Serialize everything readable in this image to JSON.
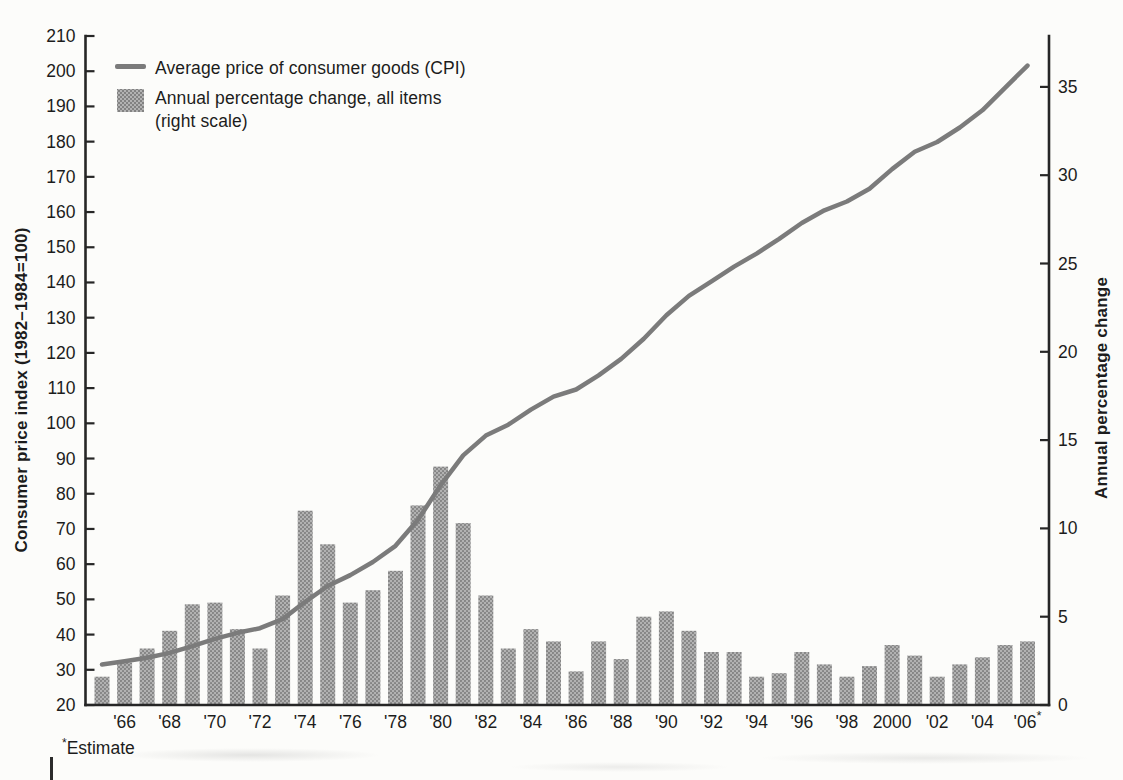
{
  "legend": {
    "line_label": "Average price of consumer goods (CPI)",
    "bar_label_line1": "Annual percentage change, all items",
    "bar_label_line2": "(right scale)"
  },
  "left_axis_title": "Consumer price index (1982–1984=100)",
  "right_axis_title": "Annual percentage change",
  "note": {
    "asterisk": "*",
    "text": "Estimate"
  },
  "colors": {
    "bar_fill": "#a2a2a2",
    "bar_dot": "#828282",
    "bar_base": "#b2b2b2",
    "line": "#7b7b7b",
    "axis": "#262626",
    "background": "#fcfcfa",
    "text": "#1c1c1c"
  },
  "chart_data": {
    "type": "bar",
    "subtype": "bar-and-line-dual-axis",
    "x": [
      1965,
      1966,
      1967,
      1968,
      1969,
      1970,
      1971,
      1972,
      1973,
      1974,
      1975,
      1976,
      1977,
      1978,
      1979,
      1980,
      1981,
      1982,
      1983,
      1984,
      1985,
      1986,
      1987,
      1988,
      1989,
      1990,
      1991,
      1992,
      1993,
      1994,
      1995,
      1996,
      1997,
      1998,
      1999,
      2000,
      2001,
      2002,
      2003,
      2004,
      2005,
      2006
    ],
    "series": [
      {
        "name": "Average price of consumer goods (CPI)",
        "type": "line",
        "axis": "left",
        "values": [
          31.5,
          32.4,
          33.4,
          34.8,
          36.7,
          38.8,
          40.5,
          41.8,
          44.4,
          49.3,
          53.8,
          56.9,
          60.6,
          65.2,
          72.6,
          82.4,
          90.9,
          96.5,
          99.6,
          103.9,
          107.6,
          109.6,
          113.6,
          118.3,
          124.0,
          130.7,
          136.2,
          140.3,
          144.5,
          148.2,
          152.4,
          156.9,
          160.5,
          163.0,
          166.6,
          172.2,
          177.1,
          179.9,
          184.0,
          188.9,
          195.3,
          201.6
        ]
      },
      {
        "name": "Annual percentage change, all items (right scale)",
        "type": "bar",
        "axis": "right",
        "values": [
          1.6,
          2.4,
          3.2,
          4.2,
          5.7,
          5.8,
          4.3,
          3.2,
          6.2,
          11.0,
          9.1,
          5.8,
          6.5,
          7.6,
          11.3,
          13.5,
          10.3,
          6.2,
          3.2,
          4.3,
          3.6,
          1.9,
          3.6,
          2.6,
          5.0,
          5.3,
          4.2,
          3.0,
          3.0,
          1.6,
          1.8,
          3.0,
          2.3,
          1.6,
          2.2,
          3.4,
          2.8,
          1.6,
          2.3,
          2.7,
          3.4,
          3.6
        ]
      }
    ],
    "left_axis": {
      "label": "Consumer price index (1982–1984=100)",
      "min": 20,
      "max": 210,
      "tick_step": 10
    },
    "right_axis": {
      "label": "Annual percentage change",
      "min": 0,
      "max": 35,
      "tick_step": 5
    },
    "x_tick_years": [
      1966,
      1968,
      1970,
      1972,
      1974,
      1976,
      1978,
      1980,
      1982,
      1984,
      1986,
      1988,
      1990,
      1992,
      1994,
      1996,
      1998,
      2000,
      2002,
      2004,
      2006
    ],
    "x_tick_labels": [
      "'66",
      "'68",
      "'70",
      "'72",
      "'74",
      "'76",
      "'78",
      "'80",
      "'82",
      "'84",
      "'86",
      "'88",
      "'90",
      "'92",
      "'94",
      "'96",
      "'98",
      "2000",
      "'02",
      "'04",
      "'06*"
    ],
    "annotations": [
      "*Estimate"
    ],
    "legend_position": "top-left",
    "grid": false,
    "last_value_is_estimate": true
  }
}
